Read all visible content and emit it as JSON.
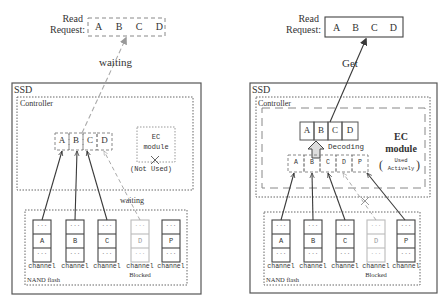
{
  "left": {
    "read_request": {
      "label_line1": "Read",
      "label_line2": "Request:",
      "cells": [
        "A",
        "B",
        "C",
        "D"
      ]
    },
    "arrow_label": "waiting",
    "ssd_label": "SSD",
    "controller_label": "Controller",
    "buffer_cells": [
      "A",
      "B",
      "C",
      "D"
    ],
    "ec_module": {
      "line1": "EC",
      "line2": "module",
      "status": "(Not Used)"
    },
    "nand_label": "NAND flash",
    "nand_waiting_label": "waiting",
    "channels": [
      {
        "data": "A",
        "label": "channel",
        "blocked": false
      },
      {
        "data": "B",
        "label": "channel",
        "blocked": false
      },
      {
        "data": "C",
        "label": "channel",
        "blocked": false
      },
      {
        "data": "D",
        "label": "channel",
        "blocked": true,
        "note": "Blocked"
      },
      {
        "data": "P",
        "label": "channel",
        "blocked": false
      }
    ],
    "ellipsis": "..."
  },
  "right": {
    "read_request": {
      "label_line1": "Read",
      "label_line2": "Request:",
      "cells": [
        "A",
        "B",
        "C",
        "D"
      ]
    },
    "arrow_label": "Get",
    "ssd_label": "SSD",
    "controller_label": "Controller",
    "decoded_cells": [
      "A",
      "B",
      "C",
      "D"
    ],
    "decoding_label": "Decoding",
    "ec_module": {
      "line1": "EC",
      "line2": "module",
      "status_line1": "Used",
      "status_line2": "Actively"
    },
    "input_cells": [
      "A",
      "B",
      "C",
      "D",
      "P"
    ],
    "nand_label": "NAND flash",
    "channels": [
      {
        "data": "A",
        "label": "channel",
        "blocked": false
      },
      {
        "data": "B",
        "label": "channel",
        "blocked": false
      },
      {
        "data": "C",
        "label": "channel",
        "blocked": false
      },
      {
        "data": "D",
        "label": "channel",
        "blocked": true,
        "note": "Blocked"
      },
      {
        "data": "P",
        "label": "channel",
        "blocked": false
      }
    ],
    "ellipsis": "..."
  },
  "colors": {
    "line": "#3a3a3a",
    "dashed": "#9a9a9a",
    "blocked": "#b5b5b5"
  }
}
